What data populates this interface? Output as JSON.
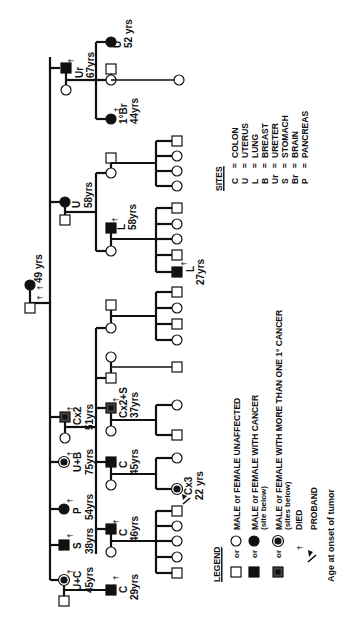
{
  "diagram": {
    "type": "pedigree",
    "orientation": "rotated-90-ccw",
    "founders": {
      "father": {
        "sex": "male",
        "status": "unaffected",
        "died": true,
        "died_symbol": "†"
      },
      "mother": {
        "sex": "female",
        "status": "cancer",
        "died": true,
        "died_symbol": "†",
        "age": "49 yrs"
      }
    },
    "generation2": [
      {
        "id": "g2-1",
        "sex": "male",
        "status": "cancer",
        "died": true,
        "site": "Ur",
        "age": "67yrs"
      },
      {
        "id": "g2-2",
        "sex": "female",
        "status": "cancer",
        "died": false,
        "site": "U",
        "age": "58yrs"
      },
      {
        "id": "g2-3",
        "sex": "male",
        "status": "multiple",
        "died": true,
        "site": "Cx2",
        "age": "51yrs"
      },
      {
        "id": "g2-4",
        "sex": "female",
        "status": "multiple",
        "died": true,
        "site": "U+B",
        "age": "75yrs"
      },
      {
        "id": "g2-5",
        "sex": "female",
        "status": "cancer",
        "died": true,
        "site": "P",
        "age": "54yrs"
      },
      {
        "id": "g2-6",
        "sex": "male",
        "status": "cancer",
        "died": true,
        "site": "S",
        "age": "38yrs"
      },
      {
        "id": "g2-7",
        "sex": "female",
        "status": "multiple",
        "died": true,
        "site": "U+C",
        "age": "45yrs"
      }
    ],
    "generation3": [
      {
        "id": "g3-1",
        "sex": "female",
        "status": "cancer",
        "site": "U",
        "age": "52 yrs"
      },
      {
        "id": "g3-2",
        "sex": "female",
        "status": "unaffected"
      },
      {
        "id": "g3-3",
        "sex": "female",
        "status": "cancer",
        "died": true,
        "site": "1°Br",
        "age": "44yrs"
      },
      {
        "id": "g3-4",
        "sex": "female",
        "status": "unaffected"
      },
      {
        "id": "g3-5",
        "sex": "female",
        "status": "unaffected",
        "spouse": {
          "sex": "male",
          "status": "cancer",
          "died": true,
          "site": "L",
          "age": "58yrs"
        }
      },
      {
        "id": "g3-6",
        "sex": "female",
        "status": "unaffected"
      },
      {
        "id": "g3-7",
        "sex": "male",
        "status": "unaffected"
      },
      {
        "id": "g3-8",
        "sex": "male",
        "status": "multiple",
        "died": true,
        "site": "Cx2+S",
        "age": "37yrs"
      },
      {
        "id": "g3-9",
        "sex": "male",
        "status": "cancer",
        "site": "C",
        "age": "45yrs"
      },
      {
        "id": "g3-10",
        "sex": "male",
        "status": "cancer",
        "died": true,
        "site": "C",
        "age": "46yrs"
      },
      {
        "id": "g3-11",
        "sex": "male",
        "status": "cancer",
        "died": true,
        "site": "C",
        "age": "29yrs"
      }
    ],
    "generation4_notes": {
      "l_27": {
        "sex": "male",
        "status": "multiple",
        "died": true,
        "site": "L",
        "age": "27yrs"
      },
      "proband": {
        "sex": "female",
        "status": "multiple",
        "site": "Cx3",
        "age": "22 yrs"
      }
    }
  },
  "labels": {
    "founder_age": "49 yrs",
    "died": "†",
    "g2": {
      "ur": "Ur",
      "ur_age": "67yrs",
      "u": "U",
      "u_age": "58yrs",
      "cx2": "Cx2",
      "cx2_age": "51yrs",
      "ub": "U+B",
      "ub_age": "75yrs",
      "p": "P",
      "p_age": "54yrs",
      "s": "S",
      "s_age": "38yrs",
      "uc": "U+C",
      "uc_age": "45yrs"
    },
    "g3": {
      "u": "U",
      "u_age": "52 yrs",
      "br": "1°Br",
      "br_age": "44yrs",
      "l": "L",
      "l_age": "58yrs",
      "cx2s": "Cx2+S",
      "cx2s_age": "37yrs",
      "c45": "C",
      "c45_age": "45yrs",
      "c46": "C",
      "c46_age": "46yrs",
      "c29": "C",
      "c29_age": "29yrs"
    },
    "g4": {
      "l": "L",
      "l_age": "27yrs",
      "cx3": "Cx3",
      "cx3_age": "22 yrs"
    }
  },
  "sites": {
    "title": "SITES",
    "items": [
      {
        "code": "C",
        "eq": "=",
        "name": "COLON"
      },
      {
        "code": "U",
        "eq": "=",
        "name": "UTERUS"
      },
      {
        "code": "L",
        "eq": "=",
        "name": "LUNG"
      },
      {
        "code": "B",
        "eq": "=",
        "name": "BREAST"
      },
      {
        "code": "Ur",
        "eq": "=",
        "name": "URETER"
      },
      {
        "code": "S",
        "eq": "=",
        "name": "STOMACH"
      },
      {
        "code": "Br",
        "eq": "=",
        "name": "BRAIN"
      },
      {
        "code": "P",
        "eq": "=",
        "name": "PANCREAS"
      }
    ]
  },
  "legend": {
    "title": "LEGEND",
    "or": "or",
    "unaffected": "MALE or FEMALE UNAFFECTED",
    "cancer": "MALE or FEMALE WITH CANCER",
    "cancer_note": "(site below)",
    "multiple": "MALE or FEMALE WITH MORE THAN ONE 1° CANCER",
    "multiple_note": "(sites below)",
    "died_symbol": "†",
    "died": "DIED",
    "proband": "PROBAND",
    "age_note": "Age at onset of tumor"
  }
}
